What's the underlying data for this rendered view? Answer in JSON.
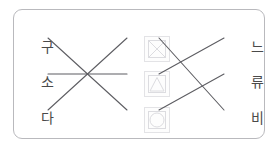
{
  "exercise": {
    "card_border_color": "#b9b9bd",
    "background_color": "#ffffff",
    "line_color": "#5d5d62",
    "text_color": "#4a4a4a"
  },
  "left_column": {
    "items": [
      {
        "label": "구"
      },
      {
        "label": "소"
      },
      {
        "label": "다"
      }
    ]
  },
  "middle_column": {
    "items": [
      {
        "icon": "square-with-diagonals-image-placeholder-icon"
      },
      {
        "icon": "triangle-image-placeholder-icon"
      },
      {
        "icon": "circle-image-placeholder-icon"
      }
    ]
  },
  "right_column": {
    "items": [
      {
        "label": "느"
      },
      {
        "label": "류"
      },
      {
        "label": "비"
      }
    ]
  },
  "connections": {
    "left_group": [
      {
        "from": "left-1",
        "to": "middle-3"
      },
      {
        "from": "left-2",
        "to": "middle-2"
      },
      {
        "from": "left-3",
        "to": "middle-1"
      }
    ],
    "right_group": [
      {
        "from": "middle-1",
        "to": "right-3"
      },
      {
        "from": "middle-2",
        "to": "right-1"
      },
      {
        "from": "middle-3",
        "to": "right-2"
      }
    ]
  }
}
